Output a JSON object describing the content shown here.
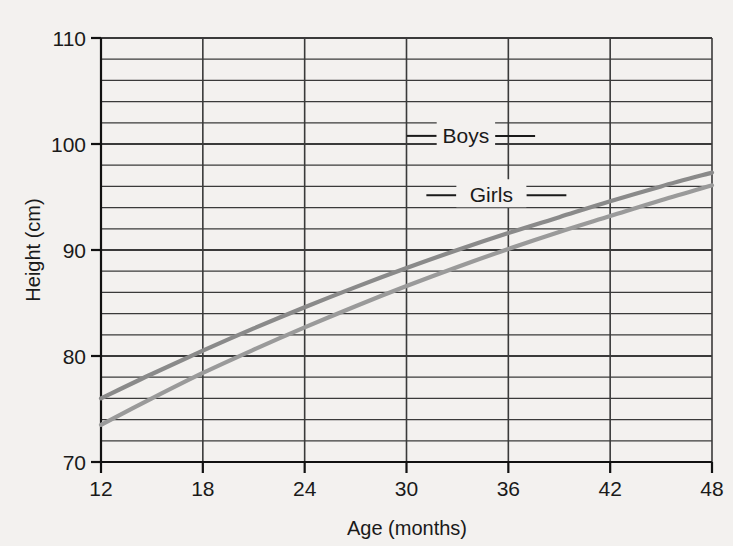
{
  "chart_data": {
    "type": "line",
    "title": "",
    "subtitle": "",
    "xlabel": "Age (months)",
    "ylabel": "Height (cm)",
    "xlim": [
      12,
      48
    ],
    "ylim": [
      70,
      110
    ],
    "xticks": [
      12,
      18,
      24,
      30,
      36,
      42,
      48
    ],
    "yticks": [
      70,
      80,
      90,
      100,
      110
    ],
    "y_gridline_step": 2,
    "x_gridline_step": 6,
    "grid": true,
    "legend_position": "inline-annotation",
    "x": [
      12,
      15,
      18,
      21,
      24,
      27,
      30,
      33,
      36,
      39,
      42,
      45,
      48
    ],
    "series": [
      {
        "name": "Boys",
        "color": "#8a8a8a",
        "values": [
          76.0,
          78.3,
          80.5,
          82.6,
          84.6,
          86.5,
          88.3,
          90.0,
          91.6,
          93.1,
          94.6,
          96.0,
          97.3
        ],
        "label_note": "upper curve"
      },
      {
        "name": "Girls",
        "color": "#9a9a9a",
        "values": [
          73.5,
          76.0,
          78.4,
          80.6,
          82.7,
          84.7,
          86.6,
          88.4,
          90.1,
          91.7,
          93.2,
          94.7,
          96.1
        ],
        "label_note": "lower curve"
      }
    ],
    "annotations": [
      {
        "text": "Boys",
        "x_months": 33.5,
        "y_cm": 100.2,
        "leader": true
      },
      {
        "text": "Girls",
        "x_months": 35.0,
        "y_cm": 94.6,
        "leader": true
      }
    ],
    "colors": {
      "background": "#f3f1ef",
      "gridline": "#3a3a3a",
      "axis": "#111111",
      "text": "#1a1a1a",
      "boys_line": "#8a8a8a",
      "girls_line": "#9a9a9a"
    }
  },
  "axes": {
    "x_tick_labels": [
      "12",
      "18",
      "24",
      "30",
      "36",
      "42",
      "48"
    ],
    "y_tick_labels": [
      "70",
      "80",
      "90",
      "100",
      "110"
    ],
    "x_axis_title": "Age (months)",
    "y_axis_title": "Height (cm)"
  },
  "series_labels": {
    "boys": "Boys",
    "girls": "Girls"
  }
}
